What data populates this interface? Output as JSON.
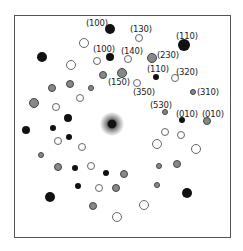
{
  "figure": {
    "type": "electron diffraction pattern",
    "center_beam": {
      "x": 112,
      "y": 124
    },
    "spots": [
      {
        "x": 110,
        "y": 29,
        "r": 5,
        "kind": "filled"
      },
      {
        "x": 139,
        "y": 38,
        "r": 4,
        "kind": "open"
      },
      {
        "x": 184,
        "y": 45,
        "r": 6,
        "kind": "filled"
      },
      {
        "x": 84,
        "y": 43,
        "r": 5,
        "kind": "open"
      },
      {
        "x": 42,
        "y": 57,
        "r": 5,
        "kind": "filled"
      },
      {
        "x": 110,
        "y": 57,
        "r": 4,
        "kind": "filled"
      },
      {
        "x": 97,
        "y": 61,
        "r": 4,
        "kind": "open"
      },
      {
        "x": 128,
        "y": 59,
        "r": 4,
        "kind": "open"
      },
      {
        "x": 152,
        "y": 58,
        "r": 5,
        "kind": "grey"
      },
      {
        "x": 71,
        "y": 65,
        "r": 5,
        "kind": "open"
      },
      {
        "x": 122,
        "y": 73,
        "r": 5,
        "kind": "grey"
      },
      {
        "x": 103,
        "y": 75,
        "r": 4,
        "kind": "grey"
      },
      {
        "x": 156,
        "y": 77,
        "r": 3,
        "kind": "filled"
      },
      {
        "x": 175,
        "y": 78,
        "r": 4,
        "kind": "open"
      },
      {
        "x": 137,
        "y": 83,
        "r": 4,
        "kind": "open"
      },
      {
        "x": 70,
        "y": 84,
        "r": 4,
        "kind": "grey"
      },
      {
        "x": 52,
        "y": 88,
        "r": 4,
        "kind": "grey"
      },
      {
        "x": 91,
        "y": 88,
        "r": 3,
        "kind": "grey"
      },
      {
        "x": 193,
        "y": 92,
        "r": 3,
        "kind": "grey"
      },
      {
        "x": 80,
        "y": 98,
        "r": 4,
        "kind": "open"
      },
      {
        "x": 34,
        "y": 103,
        "r": 5,
        "kind": "grey"
      },
      {
        "x": 56,
        "y": 107,
        "r": 4,
        "kind": "open"
      },
      {
        "x": 165,
        "y": 112,
        "r": 3,
        "kind": "grey"
      },
      {
        "x": 68,
        "y": 118,
        "r": 4,
        "kind": "filled"
      },
      {
        "x": 182,
        "y": 120,
        "r": 3,
        "kind": "filled"
      },
      {
        "x": 207,
        "y": 121,
        "r": 4,
        "kind": "grey"
      },
      {
        "x": 26,
        "y": 130,
        "r": 4,
        "kind": "filled"
      },
      {
        "x": 53,
        "y": 128,
        "r": 3,
        "kind": "filled"
      },
      {
        "x": 165,
        "y": 132,
        "r": 4,
        "kind": "open"
      },
      {
        "x": 181,
        "y": 135,
        "r": 4,
        "kind": "open"
      },
      {
        "x": 69,
        "y": 137,
        "r": 3,
        "kind": "filled"
      },
      {
        "x": 58,
        "y": 141,
        "r": 4,
        "kind": "open"
      },
      {
        "x": 157,
        "y": 144,
        "r": 5,
        "kind": "open"
      },
      {
        "x": 82,
        "y": 147,
        "r": 4,
        "kind": "open"
      },
      {
        "x": 196,
        "y": 149,
        "r": 5,
        "kind": "open"
      },
      {
        "x": 41,
        "y": 155,
        "r": 3,
        "kind": "grey"
      },
      {
        "x": 177,
        "y": 164,
        "r": 4,
        "kind": "grey"
      },
      {
        "x": 58,
        "y": 167,
        "r": 4,
        "kind": "grey"
      },
      {
        "x": 159,
        "y": 166,
        "r": 3,
        "kind": "grey"
      },
      {
        "x": 75,
        "y": 168,
        "r": 3,
        "kind": "filled"
      },
      {
        "x": 91,
        "y": 166,
        "r": 4,
        "kind": "open"
      },
      {
        "x": 106,
        "y": 173,
        "r": 3,
        "kind": "filled"
      },
      {
        "x": 124,
        "y": 174,
        "r": 4,
        "kind": "grey"
      },
      {
        "x": 78,
        "y": 186,
        "r": 3,
        "kind": "filled"
      },
      {
        "x": 99,
        "y": 188,
        "r": 4,
        "kind": "open"
      },
      {
        "x": 116,
        "y": 188,
        "r": 4,
        "kind": "grey"
      },
      {
        "x": 157,
        "y": 185,
        "r": 3,
        "kind": "grey"
      },
      {
        "x": 187,
        "y": 193,
        "r": 5,
        "kind": "filled"
      },
      {
        "x": 50,
        "y": 197,
        "r": 5,
        "kind": "filled"
      },
      {
        "x": 144,
        "y": 205,
        "r": 5,
        "kind": "open"
      },
      {
        "x": 93,
        "y": 206,
        "r": 4,
        "kind": "grey"
      },
      {
        "x": 117,
        "y": 217,
        "r": 5,
        "kind": "open"
      }
    ],
    "labels": [
      {
        "text": "(100)",
        "x": 86,
        "y": 19
      },
      {
        "text": "(130)",
        "x": 130,
        "y": 25
      },
      {
        "text": "(110)",
        "x": 176,
        "y": 32
      },
      {
        "text": "(100)",
        "x": 93,
        "y": 45
      },
      {
        "text": "(140)",
        "x": 121,
        "y": 47
      },
      {
        "text": "(230)",
        "x": 157,
        "y": 51
      },
      {
        "text": "(110)",
        "x": 147,
        "y": 65
      },
      {
        "text": "(320)",
        "x": 176,
        "y": 68
      },
      {
        "text": "(150)",
        "x": 108,
        "y": 78
      },
      {
        "text": "(350)",
        "x": 133,
        "y": 88
      },
      {
        "text": "(310)",
        "x": 197,
        "y": 88
      },
      {
        "text": "(530)",
        "x": 150,
        "y": 101
      },
      {
        "text": "(010)",
        "x": 176,
        "y": 110
      },
      {
        "text": "(010)",
        "x": 202,
        "y": 110
      }
    ]
  }
}
